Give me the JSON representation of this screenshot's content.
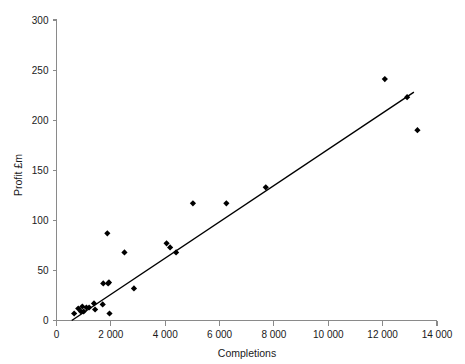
{
  "chart_data": {
    "type": "scatter",
    "title": "",
    "xlabel": "Completions",
    "ylabel": "Profit £m",
    "xlim": [
      0,
      14000
    ],
    "ylim": [
      0,
      300
    ],
    "grid": false,
    "legend": "none",
    "x_ticks": [
      "0",
      "2 000",
      "4 000",
      "6 000",
      "8 000",
      "10 000",
      "12 000",
      "14 000"
    ],
    "x_tick_values": [
      0,
      2000,
      4000,
      6000,
      8000,
      10000,
      12000,
      14000
    ],
    "y_ticks": [
      "0",
      "50",
      "100",
      "150",
      "200",
      "250",
      "300"
    ],
    "y_tick_values": [
      0,
      50,
      100,
      150,
      200,
      250,
      300
    ],
    "marker": "diamond",
    "marker_color": "#000000",
    "points": [
      {
        "x": 650,
        "y": 7
      },
      {
        "x": 800,
        "y": 12
      },
      {
        "x": 900,
        "y": 9
      },
      {
        "x": 950,
        "y": 14
      },
      {
        "x": 1000,
        "y": 9
      },
      {
        "x": 1100,
        "y": 13
      },
      {
        "x": 1200,
        "y": 13
      },
      {
        "x": 1380,
        "y": 17
      },
      {
        "x": 1420,
        "y": 11
      },
      {
        "x": 1700,
        "y": 16
      },
      {
        "x": 1720,
        "y": 37
      },
      {
        "x": 1870,
        "y": 87
      },
      {
        "x": 1900,
        "y": 37
      },
      {
        "x": 1930,
        "y": 38
      },
      {
        "x": 1950,
        "y": 7
      },
      {
        "x": 2500,
        "y": 68
      },
      {
        "x": 2850,
        "y": 32
      },
      {
        "x": 4050,
        "y": 77
      },
      {
        "x": 4180,
        "y": 73
      },
      {
        "x": 4400,
        "y": 68
      },
      {
        "x": 5020,
        "y": 117
      },
      {
        "x": 6250,
        "y": 117
      },
      {
        "x": 7700,
        "y": 133
      },
      {
        "x": 12080,
        "y": 241
      },
      {
        "x": 12900,
        "y": 223
      },
      {
        "x": 13280,
        "y": 190
      }
    ],
    "trend_line": {
      "label": "linear fit",
      "x_start": 560,
      "y_start": 0,
      "x_end": 13150,
      "y_end": 228
    }
  },
  "axes": {
    "x_axis_name": "completions-axis",
    "y_axis_name": "profit-axis"
  }
}
